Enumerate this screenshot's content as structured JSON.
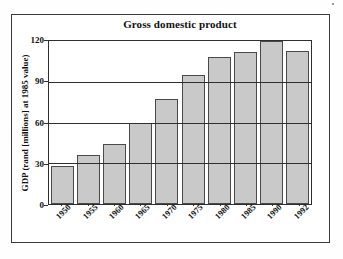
{
  "chart_data": {
    "type": "bar",
    "title": "Gross domestic product",
    "xlabel": "",
    "ylabel": "GDP (rand [millions] at 1985 value)",
    "categories": [
      "1950",
      "1955",
      "1960",
      "1965",
      "1970",
      "1975",
      "1980",
      "1985",
      "1990",
      "1992"
    ],
    "values": [
      28,
      36,
      44,
      60,
      77,
      95,
      108,
      112,
      120,
      113
    ],
    "ylim": [
      0,
      120
    ],
    "yticks": [
      "0",
      "30",
      "60",
      "90",
      "120"
    ],
    "ytick_values": [
      0,
      30,
      60,
      90,
      120
    ],
    "grid": true,
    "legend": "none",
    "bar_fill": "#c9c9c9",
    "bar_edge": "#4a4a4a",
    "axis_color": "#2f2f2f"
  }
}
